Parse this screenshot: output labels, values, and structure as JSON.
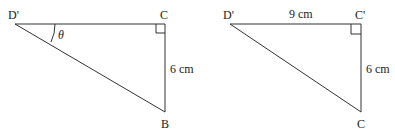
{
  "figures": [
    {
      "name": "triangle-left",
      "vertices": {
        "top_left": "D'",
        "top_right": "C",
        "bottom": "B"
      },
      "angle_label": "θ",
      "side_labels": {
        "right": "6 cm"
      },
      "right_angle_at": "C"
    },
    {
      "name": "triangle-right",
      "vertices": {
        "top_left": "D'",
        "top_right": "C'",
        "bottom": "C"
      },
      "side_labels": {
        "top": "9 cm",
        "right": "6 cm"
      },
      "right_angle_at": "C'"
    }
  ],
  "colors": {
    "line": "#333333",
    "text": "#222222",
    "background": "#ffffff"
  }
}
